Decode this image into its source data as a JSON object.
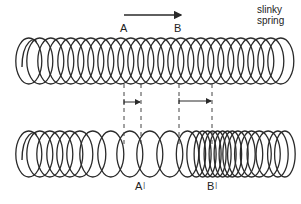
{
  "diagram": {
    "title_label": {
      "line1": "slinky",
      "line2": "spring"
    },
    "direction_arrow": {
      "x1": 124,
      "x2": 181,
      "y": 15,
      "from_label": "A",
      "to_label": "B"
    },
    "top_labels": [
      {
        "text": "A",
        "x": 120,
        "y": 23
      },
      {
        "text": "B",
        "x": 174,
        "y": 23
      }
    ],
    "bottom_labels": [
      {
        "text": "A",
        "prime": "|",
        "x": 135,
        "y": 181
      },
      {
        "text": "B",
        "prime": "|",
        "x": 207,
        "y": 181
      }
    ],
    "colors": {
      "line": "#2a2a2a",
      "dash": "#444444",
      "background": "#ffffff"
    },
    "top_spring": {
      "y_top": 38,
      "y_bottom": 84,
      "hook_x": 22,
      "coil_x": [
        34,
        45,
        56,
        66,
        76,
        86,
        96,
        106,
        116,
        126,
        136,
        146,
        156,
        166,
        176,
        186,
        196,
        206,
        216,
        226,
        236,
        246,
        256,
        266,
        276,
        286
      ]
    },
    "bottom_spring": {
      "y_top": 131,
      "y_bottom": 177,
      "hook_x": 22,
      "coil_x": [
        34,
        45,
        55,
        65,
        75,
        85,
        98,
        116,
        135,
        155,
        175,
        192,
        200,
        206,
        211,
        216,
        221,
        226,
        231,
        236,
        242,
        249,
        256,
        264,
        273,
        282,
        289
      ]
    },
    "markers": [
      {
        "name": "A-displacement",
        "x1": 124,
        "x2": 141,
        "arrow_y": 102,
        "dash_top": 84,
        "dash_bottom": 148
      },
      {
        "name": "B-displacement",
        "x1": 179,
        "x2": 212,
        "arrow_y": 101,
        "dash_top": 84,
        "dash_bottom": 148
      }
    ]
  }
}
